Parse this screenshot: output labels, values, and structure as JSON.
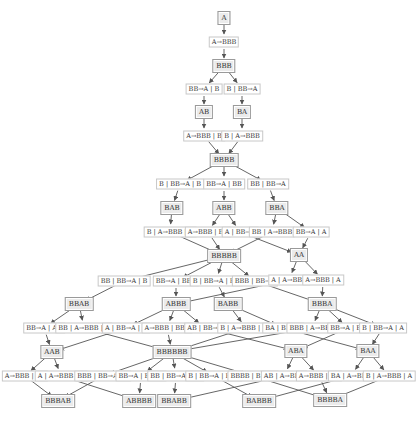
{
  "diagram": {
    "type": "multiway-substitution-graph",
    "edge_color": "#555555",
    "state_fill": "#ebebeb",
    "state_border": "#9a9a9a",
    "step_border": "#c8c8c8",
    "nodes": [
      {
        "id": "s_A",
        "kind": "state",
        "label": "A",
        "x": 224,
        "y": 18
      },
      {
        "id": "e1",
        "kind": "step",
        "label": "A→BBB",
        "x": 224,
        "y": 42
      },
      {
        "id": "s_BBB",
        "kind": "state",
        "label": "BBB",
        "x": 224,
        "y": 66
      },
      {
        "id": "e2",
        "kind": "step",
        "label": "BB→A | B",
        "x": 204,
        "y": 89
      },
      {
        "id": "e3",
        "kind": "step",
        "label": "B | BB→A",
        "x": 242,
        "y": 89
      },
      {
        "id": "s_AB",
        "kind": "state",
        "label": "AB",
        "x": 204,
        "y": 112
      },
      {
        "id": "s_BA",
        "kind": "state",
        "label": "BA",
        "x": 242,
        "y": 112
      },
      {
        "id": "e4",
        "kind": "step",
        "label": "A→BBB | B",
        "x": 204,
        "y": 136
      },
      {
        "id": "e5",
        "kind": "step",
        "label": "B | A→BBB",
        "x": 242,
        "y": 136
      },
      {
        "id": "s_BBBB",
        "kind": "state",
        "label": "BBBB",
        "x": 224,
        "y": 160
      },
      {
        "id": "e6",
        "kind": "step",
        "label": "B | BB→A | B",
        "x": 180,
        "y": 184
      },
      {
        "id": "e7",
        "kind": "step",
        "label": "BB→A | BB",
        "x": 224,
        "y": 184
      },
      {
        "id": "e8",
        "kind": "step",
        "label": "BB | BB→A",
        "x": 268,
        "y": 184
      },
      {
        "id": "s_BAB",
        "kind": "state",
        "label": "BAB",
        "x": 172,
        "y": 208
      },
      {
        "id": "s_ABB",
        "kind": "state",
        "label": "ABB",
        "x": 224,
        "y": 208
      },
      {
        "id": "s_BBA",
        "kind": "state",
        "label": "BBA",
        "x": 277,
        "y": 208
      },
      {
        "id": "e9",
        "kind": "step",
        "label": "B | A→BBB | B",
        "x": 170,
        "y": 232
      },
      {
        "id": "e10",
        "kind": "step",
        "label": "A→BBB | BB",
        "x": 208,
        "y": 232
      },
      {
        "id": "e11",
        "kind": "step",
        "label": "A | BB→A",
        "x": 240,
        "y": 232
      },
      {
        "id": "e12",
        "kind": "step",
        "label": "BB | A→BBB",
        "x": 272,
        "y": 232
      },
      {
        "id": "e13",
        "kind": "step",
        "label": "BB→A | A",
        "x": 311,
        "y": 232
      },
      {
        "id": "s_BBBBB",
        "kind": "state",
        "label": "BBBBB",
        "x": 224,
        "y": 256
      },
      {
        "id": "s_AA",
        "kind": "state",
        "label": "AA",
        "x": 299,
        "y": 255
      },
      {
        "id": "e14",
        "kind": "step",
        "label": "BB | BB→A | B",
        "x": 124,
        "y": 281
      },
      {
        "id": "e15",
        "kind": "step",
        "label": "BB→A | BBB",
        "x": 176,
        "y": 281
      },
      {
        "id": "e16",
        "kind": "step",
        "label": "B | BB→A | BB",
        "x": 216,
        "y": 281
      },
      {
        "id": "e17",
        "kind": "step",
        "label": "BBB | BB→A",
        "x": 255,
        "y": 281
      },
      {
        "id": "e18",
        "kind": "step",
        "label": "A | A→BBB",
        "x": 289,
        "y": 280
      },
      {
        "id": "e19",
        "kind": "step",
        "label": "A→BBB | A",
        "x": 323,
        "y": 280
      },
      {
        "id": "s_BBAB",
        "kind": "state",
        "label": "BBAB",
        "x": 79,
        "y": 304
      },
      {
        "id": "s_ABBB",
        "kind": "state",
        "label": "ABBB",
        "x": 176,
        "y": 304
      },
      {
        "id": "s_BABB",
        "kind": "state",
        "label": "BABB",
        "x": 228,
        "y": 304
      },
      {
        "id": "s_BBBA",
        "kind": "state",
        "label": "BBBA",
        "x": 322,
        "y": 304
      },
      {
        "id": "e20",
        "kind": "step",
        "label": "BB→A | AB",
        "x": 44,
        "y": 328
      },
      {
        "id": "e21",
        "kind": "step",
        "label": "BB | A→BBB | B",
        "x": 84,
        "y": 328
      },
      {
        "id": "e22",
        "kind": "step",
        "label": "A | BB→A | B",
        "x": 126,
        "y": 328
      },
      {
        "id": "e23",
        "kind": "step",
        "label": "A→BBB | BBB",
        "x": 167,
        "y": 328
      },
      {
        "id": "e24",
        "kind": "step",
        "label": "AB | BB→A",
        "x": 205,
        "y": 328
      },
      {
        "id": "e25",
        "kind": "step",
        "label": "B | A→BBB | BB",
        "x": 246,
        "y": 328
      },
      {
        "id": "e26",
        "kind": "step",
        "label": "BA | BB→A",
        "x": 283,
        "y": 328
      },
      {
        "id": "e27",
        "kind": "step",
        "label": "BBB | A→BBB",
        "x": 312,
        "y": 328
      },
      {
        "id": "e28",
        "kind": "step",
        "label": "BB→A | BA",
        "x": 348,
        "y": 328
      },
      {
        "id": "e29",
        "kind": "step",
        "label": "B | BB→A | A",
        "x": 383,
        "y": 328
      },
      {
        "id": "s_AAB",
        "kind": "state",
        "label": "AAB",
        "x": 52,
        "y": 352
      },
      {
        "id": "s_BBBBBB",
        "kind": "state",
        "label": "BBBBBB",
        "x": 172,
        "y": 352
      },
      {
        "id": "s_ABA",
        "kind": "state",
        "label": "ABA",
        "x": 296,
        "y": 351
      },
      {
        "id": "s_BAA",
        "kind": "state",
        "label": "BAA",
        "x": 368,
        "y": 351
      },
      {
        "id": "e30",
        "kind": "step",
        "label": "A→BBB | AB",
        "x": 25,
        "y": 376
      },
      {
        "id": "e31",
        "kind": "step",
        "label": "A | A→BBB | B",
        "x": 61,
        "y": 376
      },
      {
        "id": "e32",
        "kind": "step",
        "label": "BBB | BB→A | B",
        "x": 103,
        "y": 376
      },
      {
        "id": "e33",
        "kind": "step",
        "label": "BB→A | BBBB",
        "x": 141,
        "y": 376
      },
      {
        "id": "e34",
        "kind": "step",
        "label": "BB | BB→A | BB",
        "x": 176,
        "y": 376
      },
      {
        "id": "e35",
        "kind": "step",
        "label": "B | BB→A | BBB",
        "x": 214,
        "y": 376
      },
      {
        "id": "e36",
        "kind": "step",
        "label": "BBBB | BB→A",
        "x": 253,
        "y": 376
      },
      {
        "id": "e37",
        "kind": "step",
        "label": "AB | A→BBB",
        "x": 284,
        "y": 376
      },
      {
        "id": "e38",
        "kind": "step",
        "label": "A→BBB | BA",
        "x": 319,
        "y": 376
      },
      {
        "id": "e39",
        "kind": "step",
        "label": "BA | A→BBB",
        "x": 351,
        "y": 376
      },
      {
        "id": "e40",
        "kind": "step",
        "label": "B | A→BBB | A",
        "x": 389,
        "y": 376
      },
      {
        "id": "s_BBBAB",
        "kind": "state",
        "label": "BBBAB",
        "x": 58,
        "y": 401
      },
      {
        "id": "s_ABBBB",
        "kind": "state",
        "label": "ABBBB",
        "x": 139,
        "y": 401
      },
      {
        "id": "s_BBABB",
        "kind": "state",
        "label": "BBABB",
        "x": 174,
        "y": 401
      },
      {
        "id": "s_BABBB",
        "kind": "state",
        "label": "BABBB",
        "x": 259,
        "y": 401
      },
      {
        "id": "s_BBBBA",
        "kind": "state",
        "label": "BBBBA",
        "x": 330,
        "y": 400
      }
    ],
    "edges": [
      [
        "s_A",
        "e1"
      ],
      [
        "e1",
        "s_BBB"
      ],
      [
        "s_BBB",
        "e2"
      ],
      [
        "s_BBB",
        "e3"
      ],
      [
        "e2",
        "s_AB"
      ],
      [
        "e3",
        "s_BA"
      ],
      [
        "s_AB",
        "e4"
      ],
      [
        "s_BA",
        "e5"
      ],
      [
        "e4",
        "s_BBBB"
      ],
      [
        "e5",
        "s_BBBB"
      ],
      [
        "s_BBBB",
        "e6"
      ],
      [
        "s_BBBB",
        "e7"
      ],
      [
        "s_BBBB",
        "e8"
      ],
      [
        "e6",
        "s_BAB"
      ],
      [
        "e7",
        "s_ABB"
      ],
      [
        "e8",
        "s_BBA"
      ],
      [
        "s_BAB",
        "e9"
      ],
      [
        "s_ABB",
        "e10"
      ],
      [
        "s_ABB",
        "e11"
      ],
      [
        "s_BBA",
        "e12"
      ],
      [
        "s_BBA",
        "e13"
      ],
      [
        "e9",
        "s_BBBBB"
      ],
      [
        "e10",
        "s_BBBBB"
      ],
      [
        "e12",
        "s_BBBBB"
      ],
      [
        "e11",
        "s_AA"
      ],
      [
        "e13",
        "s_AA"
      ],
      [
        "s_BBBBB",
        "e14"
      ],
      [
        "s_BBBBB",
        "e15"
      ],
      [
        "s_BBBBB",
        "e16"
      ],
      [
        "s_BBBBB",
        "e17"
      ],
      [
        "s_AA",
        "e18"
      ],
      [
        "s_AA",
        "e19"
      ],
      [
        "e14",
        "s_BBAB"
      ],
      [
        "e15",
        "s_ABBB"
      ],
      [
        "e16",
        "s_BABB"
      ],
      [
        "e17",
        "s_BBBA"
      ],
      [
        "e18",
        "s_ABBB"
      ],
      [
        "e19",
        "s_BBBA"
      ],
      [
        "s_BBAB",
        "e20"
      ],
      [
        "s_BBAB",
        "e21"
      ],
      [
        "s_ABBB",
        "e22"
      ],
      [
        "s_ABBB",
        "e23"
      ],
      [
        "s_ABBB",
        "e24"
      ],
      [
        "s_BABB",
        "e25"
      ],
      [
        "s_BABB",
        "e26"
      ],
      [
        "s_BBBA",
        "e27"
      ],
      [
        "s_BBBA",
        "e28"
      ],
      [
        "s_BBBA",
        "e29"
      ],
      [
        "e20",
        "s_AAB"
      ],
      [
        "e22",
        "s_AAB"
      ],
      [
        "e21",
        "s_BBBBBB"
      ],
      [
        "e23",
        "s_BBBBBB"
      ],
      [
        "e25",
        "s_BBBBBB"
      ],
      [
        "e27",
        "s_BBBBBB"
      ],
      [
        "e24",
        "s_ABA"
      ],
      [
        "e28",
        "s_ABA"
      ],
      [
        "e26",
        "s_BAA"
      ],
      [
        "e29",
        "s_BAA"
      ],
      [
        "s_AAB",
        "e30"
      ],
      [
        "s_AAB",
        "e31"
      ],
      [
        "s_BBBBBB",
        "e32"
      ],
      [
        "s_BBBBBB",
        "e33"
      ],
      [
        "s_BBBBBB",
        "e34"
      ],
      [
        "s_BBBBBB",
        "e35"
      ],
      [
        "s_BBBBBB",
        "e36"
      ],
      [
        "s_ABA",
        "e37"
      ],
      [
        "s_ABA",
        "e38"
      ],
      [
        "s_BAA",
        "e39"
      ],
      [
        "s_BAA",
        "e40"
      ],
      [
        "e30",
        "s_BBBAB"
      ],
      [
        "e32",
        "s_BBBAB"
      ],
      [
        "e31",
        "s_ABBBB"
      ],
      [
        "e33",
        "s_ABBBB"
      ],
      [
        "e34",
        "s_BBABB"
      ],
      [
        "e37",
        "s_BBABB"
      ],
      [
        "e35",
        "s_BABBB"
      ],
      [
        "e39",
        "s_BABBB"
      ],
      [
        "e36",
        "s_BBBBA"
      ],
      [
        "e38",
        "s_BBBBA"
      ],
      [
        "e40",
        "s_BBBBA"
      ]
    ]
  }
}
